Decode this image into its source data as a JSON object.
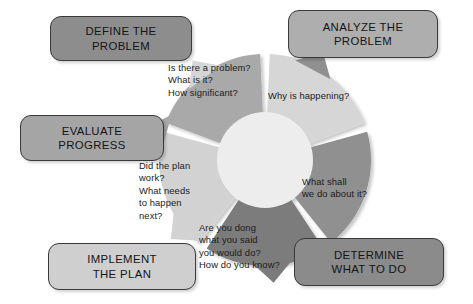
{
  "diagram": {
    "background_color": "#ffffff",
    "center": {
      "x": 265,
      "y": 160
    },
    "outer_radius": 106,
    "inner_radius": 48,
    "inner_circle_color": "#ededed",
    "divider_color": "#ffffff",
    "segments": [
      {
        "id": "define",
        "stage_label": "DEFINE THE\nPROBLEM",
        "questions": "Is there a problem?\nWhat is it?\nHow significant?",
        "wedge_color": "#d6d6d6",
        "callout_color": "#8d8d8d",
        "start_angle": -90,
        "end_angle": -18
      },
      {
        "id": "analyze",
        "stage_label": "ANALYZE THE\nPROBLEM",
        "questions": "Why is happening?",
        "wedge_color": "#909090",
        "callout_color": "#aeaeae",
        "start_angle": -18,
        "end_angle": 54
      },
      {
        "id": "determine",
        "stage_label": "DETERMINE\nWHAT TO DO",
        "questions": "What shall\nwe do about it?",
        "wedge_color": "#7b7b7b",
        "callout_color": "#8b8b8b",
        "start_angle": 54,
        "end_angle": 126
      },
      {
        "id": "implement",
        "stage_label": "IMPLEMENT\nTHE PLAN",
        "questions": "Are you dong\nwhat you said\nyou would do?\nHow do you know?",
        "wedge_color": "#d2d2d2",
        "callout_color": "#cfcfcf",
        "start_angle": 126,
        "end_angle": 198
      },
      {
        "id": "evaluate",
        "stage_label": "EVALUATE\nPROGRESS",
        "questions": "Did the plan\nwork?\nWhat needs\nto happen\nnext?",
        "wedge_color": "#a9a9a9",
        "callout_color": "#a5a5a5",
        "start_angle": 198,
        "end_angle": 270
      }
    ]
  }
}
